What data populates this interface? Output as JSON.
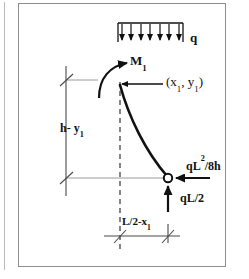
{
  "figure": {
    "kind": "free-body-diagram",
    "background_color": "#ffffff",
    "ink_color": "#111111",
    "reference_line_color": "#9a9a9a",
    "frame_color": "#8e8e8e"
  },
  "labels": {
    "distributed_load": "q",
    "moment": "M",
    "moment_sub": "1",
    "point_open": "(x",
    "point_sub1": "1",
    "point_mid": ", y",
    "point_sub2": "1",
    "point_close": ")",
    "thrust": "qL",
    "thrust_sup": "2",
    "thrust_tail": "/8h",
    "shear": "qL/2",
    "height_dim": "h- y",
    "height_dim_sub": "1",
    "span_dim": "L/2-x",
    "span_dim_sub": "1"
  },
  "geometry": {
    "apex": {
      "x": 120,
      "y": 85
    },
    "base_hinge": {
      "x": 168,
      "y": 178
    },
    "centerline_top": 82,
    "centerline_bottom": 252,
    "base_reference_y": 178,
    "top_reference_y": 80,
    "load_bar_left": 118,
    "load_bar_right": 183,
    "load_bar_y": 23,
    "load_arrow_count": 7,
    "dim_left_x": 66,
    "dim_bottom_y": 236
  }
}
